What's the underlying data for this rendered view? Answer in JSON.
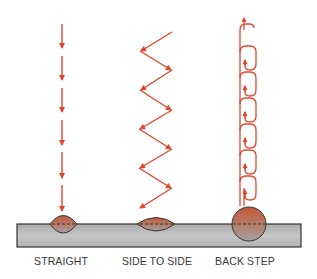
{
  "diagram": {
    "colors": {
      "arrow": "#e2452b",
      "plate_fill": "#b9b9b9",
      "plate_stroke": "#333333",
      "bead_fill": "#b5654a",
      "bead_stroke": "#333333"
    },
    "techniques": [
      {
        "id": "straight",
        "label": "STRAIGHT",
        "center_x": 63,
        "pattern": "down-arrows",
        "arrow_count": 6
      },
      {
        "id": "side-to-side",
        "label": "SIDE TO SIDE",
        "center_x": 156,
        "pattern": "zigzag",
        "zig_segments": 10
      },
      {
        "id": "back-step",
        "label": "BACK STEP",
        "center_x": 249,
        "pattern": "looped-chain",
        "loops": 7
      }
    ]
  }
}
